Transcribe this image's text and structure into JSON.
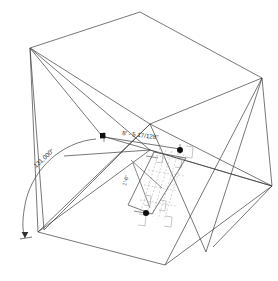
{
  "drawing": {
    "kind": "axonometric-wireframe",
    "background_color": "#ffffff",
    "line_color": "#3c3c3c",
    "detail_line_color": "#b6b6b6",
    "node_color": "#111111",
    "dimension_color": "#2a2a2a"
  },
  "annotations": {
    "linear_dimension": "8' - 5 17/128\"",
    "angular_dimension": "131.000°",
    "secondary_dimension": "1'-6\""
  },
  "geometry": {
    "top_face": "30,48 140,12 262,78 150,124",
    "bottom_face": "38,232 165,265 272,186 150,150",
    "notes": "warped prism, crossing diagonals on left and right faces"
  },
  "icon_names": {
    "node_square": "square-node-icon",
    "node_round": "round-node-icon",
    "arrow_terminator": "arrow-terminator-icon",
    "arc": "angle-arc-icon"
  }
}
